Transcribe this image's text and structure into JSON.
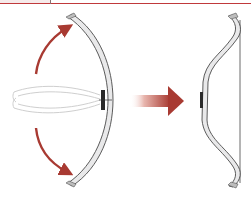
{
  "diagram": {
    "panels": [
      {
        "name": "flexing-bow",
        "label": ""
      },
      {
        "name": "transition-arrow",
        "label": ""
      },
      {
        "name": "recurve-bow",
        "label": ""
      }
    ],
    "colors": {
      "rule": "#c0393b",
      "arrow": "#a83a32",
      "arrow_light": "#f1d6d2",
      "bow_fill": "#e9e9ea",
      "bow_stroke": "#4a4a4a",
      "ghost_stroke": "#c8c8c8",
      "grip": "#2a2a2a"
    }
  }
}
